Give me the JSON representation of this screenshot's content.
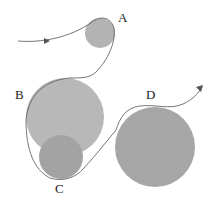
{
  "diagram": {
    "nodes": [
      {
        "id": "A",
        "label": "A",
        "cx": 100,
        "cy": 33,
        "r": 15,
        "color": "#b3b3b3",
        "label_x": 118,
        "label_y": 22
      },
      {
        "id": "B",
        "label": "B",
        "cx": 65,
        "cy": 117,
        "r": 39,
        "color": "#b8b8b8",
        "label_x": 15,
        "label_y": 99
      },
      {
        "id": "C",
        "label": "C",
        "cx": 61,
        "cy": 157,
        "r": 22,
        "color": "#a3a3a3",
        "label_x": 55,
        "label_y": 193
      },
      {
        "id": "D",
        "label": "D",
        "cx": 155,
        "cy": 147,
        "r": 40,
        "color": "#a6a6a6",
        "label_x": 146,
        "label_y": 99
      }
    ],
    "path": {
      "color": "#666666",
      "start_arrow": {
        "x": 47,
        "y": 41,
        "direction": "right"
      },
      "end_arrow": {
        "x": 202,
        "y": 87,
        "direction": "up-right"
      }
    }
  }
}
